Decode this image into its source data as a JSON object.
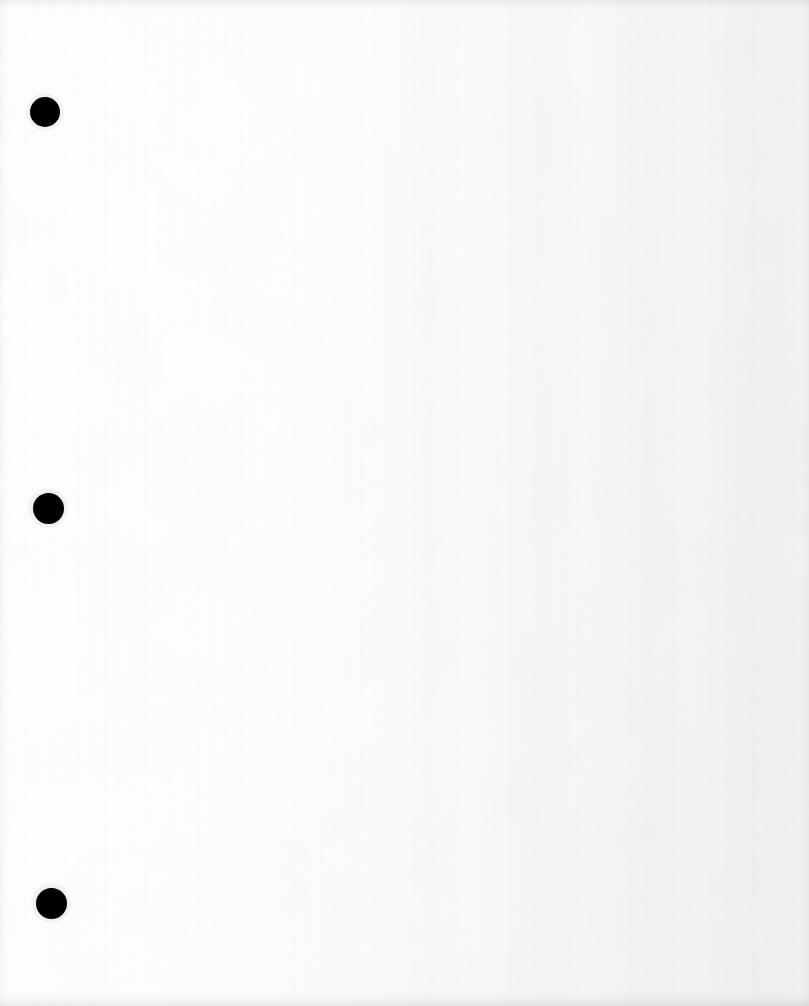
{
  "page": {
    "kind": "scanned-document-page",
    "width": 809,
    "height": 1006,
    "orientation": "portrait",
    "is_blank": true,
    "visible_text": "",
    "background_color": "#fdfdfd",
    "paper_tone": "#f7f7f8",
    "ink_color": "#000000"
  },
  "binder_holes": {
    "count": 3,
    "shape": "circle",
    "color": "#000000",
    "items": [
      {
        "name": "hole-punch-top",
        "cx": 45,
        "cy": 112,
        "diameter": 30
      },
      {
        "name": "hole-punch-middle",
        "cx": 48,
        "cy": 508,
        "diameter": 31
      },
      {
        "name": "hole-punch-bottom",
        "cx": 51,
        "cy": 903,
        "diameter": 31
      }
    ]
  },
  "scan_artifacts": {
    "vertical_banding": true,
    "paper_grain": true,
    "dark_top_edge": true,
    "dark_bottom_edge": true,
    "skew_note": "holes drift slightly right toward the bottom"
  }
}
